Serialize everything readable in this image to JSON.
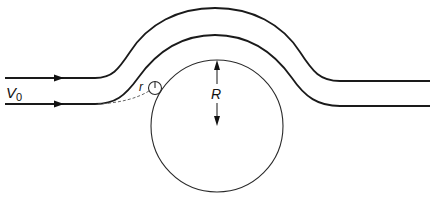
{
  "diagram": {
    "labels": {
      "velocity": "V",
      "velocity_subscript": "0",
      "large_radius": "R",
      "small_radius": "r"
    },
    "elements": {
      "streamlines": 2,
      "large_circle": {
        "cx": 217,
        "cy": 126,
        "r": 66
      },
      "small_circle": {
        "cx": 155,
        "cy": 88,
        "r": 6
      },
      "flow_direction": "left-to-right"
    },
    "colors": {
      "line": "#1a1a1a",
      "background": "#ffffff"
    }
  }
}
